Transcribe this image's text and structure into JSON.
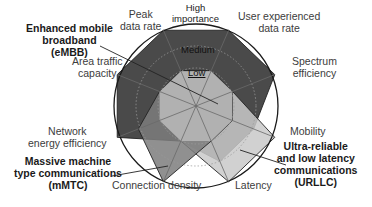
{
  "rings": {
    "high": "High importance",
    "medium": "Medium",
    "low": "Low"
  },
  "axes": [
    {
      "key": "peak",
      "label_lines": [
        "Peak",
        "data rate"
      ]
    },
    {
      "key": "user",
      "label_lines": [
        "User experienced",
        "data rate"
      ]
    },
    {
      "key": "spectrum",
      "label_lines": [
        "Spectrum",
        "efficiency"
      ]
    },
    {
      "key": "mobility",
      "label_lines": [
        "Mobility"
      ]
    },
    {
      "key": "latency",
      "label_lines": [
        "Latency"
      ]
    },
    {
      "key": "connection",
      "label_lines": [
        "Connection density"
      ]
    },
    {
      "key": "energy",
      "label_lines": [
        "Network",
        "energy efficiency"
      ]
    },
    {
      "key": "area",
      "label_lines": [
        "Area traffic",
        "capacity"
      ]
    }
  ],
  "scenarios": [
    {
      "key": "embb",
      "label_lines": [
        "Enhanced mobile",
        "broadband",
        "(eMBB)"
      ],
      "color": "#4d4d4d"
    },
    {
      "key": "mmtc",
      "label_lines": [
        "Massive machine",
        "type communications",
        "(mMTC)"
      ],
      "color": "#7a7a7a"
    },
    {
      "key": "urllc",
      "label_lines": [
        "Ultra-reliable",
        "and low latency",
        "communications",
        "(URLLC)"
      ],
      "color": "#c8c8c8"
    }
  ],
  "chart_data": {
    "type": "radar",
    "categories": [
      "Peak data rate",
      "User experienced data rate",
      "Spectrum efficiency",
      "Mobility",
      "Latency",
      "Connection density",
      "Network energy efficiency",
      "Area traffic capacity"
    ],
    "levels": [
      "Low",
      "Medium",
      "High"
    ],
    "series": [
      {
        "name": "eMBB",
        "values": [
          3,
          3,
          3,
          2,
          2,
          1,
          3,
          3
        ]
      },
      {
        "name": "mMTC",
        "values": [
          1,
          1,
          1,
          1,
          1,
          3,
          2,
          1
        ]
      },
      {
        "name": "URLLC",
        "values": [
          1,
          1,
          1,
          3,
          3,
          1,
          1,
          1
        ]
      }
    ]
  }
}
